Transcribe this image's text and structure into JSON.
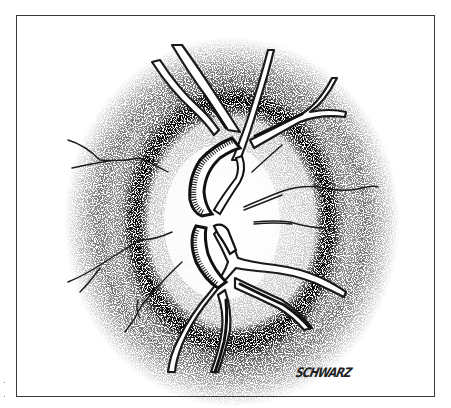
{
  "illustration": {
    "subject": "optic disc with retinal vessels",
    "style": "pen-and-ink stipple drawing",
    "signature": "SCHWARZ",
    "colors": {
      "ink": "#1a1a1a",
      "frame": "#3a3a3a",
      "background": "#ffffff"
    }
  }
}
